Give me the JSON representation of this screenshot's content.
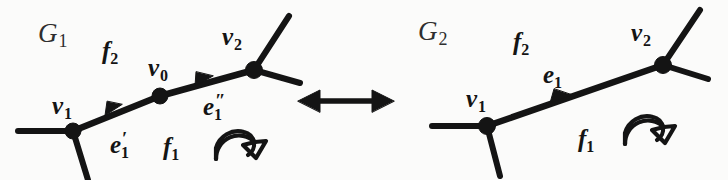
{
  "figure": {
    "background_color": "#fbfbfa",
    "ink_color": "#141414",
    "kind": "graph-transformation-diagram",
    "relation_symbol": "left-right-double-arrow"
  },
  "left_graph": {
    "name": "G",
    "name_sub": "1",
    "vertices": [
      {
        "id": "v1",
        "label": "v",
        "sub": "1",
        "x": 73,
        "y": 131
      },
      {
        "id": "v0",
        "label": "v",
        "sub": "0",
        "x": 160,
        "y": 96
      },
      {
        "id": "v2",
        "label": "v",
        "sub": "2",
        "x": 254,
        "y": 70
      }
    ],
    "edges": [
      {
        "id": "e1p",
        "label": "e",
        "sub": "1",
        "prime": "′",
        "from": "v1",
        "to": "v0",
        "directed": true
      },
      {
        "id": "e1pp",
        "label": "e",
        "sub": "1",
        "prime": "″",
        "from": "v0",
        "to": "v2",
        "directed": true
      }
    ],
    "faces": [
      {
        "id": "f2",
        "label": "f",
        "sub": "2",
        "side": "upper-left"
      },
      {
        "id": "f1",
        "label": "f",
        "sub": "1",
        "side": "lower-right"
      }
    ],
    "rotation_arrow": {
      "direction": "clockwise",
      "style": "hollow-outline"
    }
  },
  "right_graph": {
    "name": "G",
    "name_sub": "2",
    "vertices": [
      {
        "id": "v1",
        "label": "v",
        "sub": "1",
        "x": 487,
        "y": 126
      },
      {
        "id": "v2",
        "label": "v",
        "sub": "2",
        "x": 663,
        "y": 65
      }
    ],
    "edges": [
      {
        "id": "e1",
        "label": "e",
        "sub": "1",
        "prime": "",
        "from": "v1",
        "to": "v2",
        "directed": true
      }
    ],
    "faces": [
      {
        "id": "f2",
        "label": "f",
        "sub": "2",
        "side": "upper-left"
      },
      {
        "id": "f1",
        "label": "f",
        "sub": "1",
        "side": "lower-right"
      }
    ],
    "rotation_arrow": {
      "direction": "clockwise",
      "style": "hollow-outline"
    }
  }
}
